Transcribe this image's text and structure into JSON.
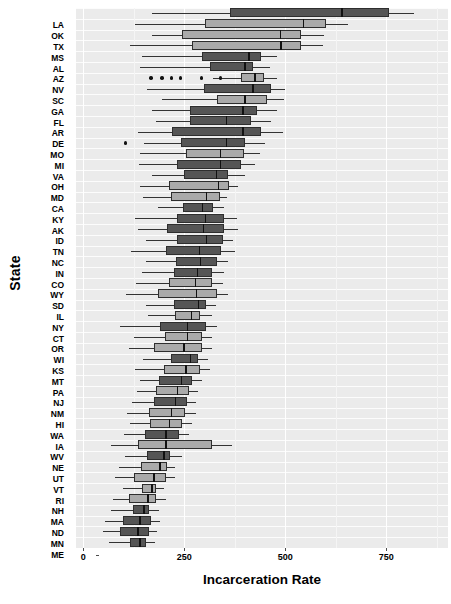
{
  "chart_data": {
    "type": "box",
    "title": "",
    "xlabel": "Incarceration Rate",
    "ylabel": "State",
    "xlim": [
      -18,
      903
    ],
    "xticks": [
      0,
      250,
      500,
      750
    ],
    "xticklabels": [
      "0",
      "250",
      "500",
      "750"
    ],
    "grid": true,
    "legend": "none",
    "orientation": "horizontal",
    "colors": {
      "panel_background": "#ebebeb",
      "gridline": "#ffffff",
      "box_dark": "#555555",
      "box_light": "#aaaaaa",
      "box_outline": "#2e2e2e",
      "median": "#111111",
      "whisker": "#333333",
      "outlier": "#111111",
      "text": "#000000"
    },
    "categories": [
      "LA",
      "OK",
      "TX",
      "MS",
      "AL",
      "AZ",
      "NV",
      "SC",
      "GA",
      "FL",
      "AR",
      "DE",
      "MO",
      "MI",
      "VA",
      "OH",
      "MD",
      "CA",
      "KY",
      "AK",
      "ID",
      "TN",
      "NC",
      "IN",
      "CO",
      "WY",
      "SD",
      "IL",
      "NY",
      "CT",
      "OR",
      "WI",
      "KS",
      "MT",
      "PA",
      "NJ",
      "NM",
      "HI",
      "WA",
      "IA",
      "WV",
      "NE",
      "UT",
      "VT",
      "RI",
      "NH",
      "MA",
      "ND",
      "MN",
      "ME"
    ],
    "boxes": [
      {
        "state": "LA",
        "whisker_low": 170,
        "q1": 363,
        "median": 640,
        "q3": 758,
        "whisker_high": 818,
        "shade": "dark",
        "outliers": []
      },
      {
        "state": "OK",
        "whisker_low": 128,
        "q1": 302,
        "median": 545,
        "q3": 600,
        "whisker_high": 655,
        "shade": "light",
        "outliers": []
      },
      {
        "state": "TX",
        "whisker_low": 170,
        "q1": 245,
        "median": 488,
        "q3": 540,
        "whisker_high": 595,
        "shade": "light",
        "outliers": []
      },
      {
        "state": "MS",
        "whisker_low": 115,
        "q1": 268,
        "median": 490,
        "q3": 540,
        "whisker_high": 593,
        "shade": "light",
        "outliers": []
      },
      {
        "state": "AL",
        "whisker_low": 145,
        "q1": 295,
        "median": 410,
        "q3": 440,
        "whisker_high": 480,
        "shade": "dark",
        "outliers": []
      },
      {
        "state": "AZ",
        "whisker_low": 140,
        "q1": 313,
        "median": 400,
        "q3": 420,
        "whisker_high": 463,
        "shade": "dark",
        "outliers": []
      },
      {
        "state": "NV",
        "whisker_low": 320,
        "q1": 390,
        "median": 425,
        "q3": 448,
        "whisker_high": 480,
        "shade": "light",
        "outliers": [
          168,
          195,
          218,
          240,
          292,
          340
        ]
      },
      {
        "state": "SC",
        "whisker_low": 158,
        "q1": 300,
        "median": 420,
        "q3": 465,
        "whisker_high": 500,
        "shade": "dark",
        "outliers": []
      },
      {
        "state": "GA",
        "whisker_low": 195,
        "q1": 330,
        "median": 400,
        "q3": 455,
        "whisker_high": 498,
        "shade": "light",
        "outliers": []
      },
      {
        "state": "FL",
        "whisker_low": 170,
        "q1": 265,
        "median": 395,
        "q3": 430,
        "whisker_high": 480,
        "shade": "dark",
        "outliers": []
      },
      {
        "state": "AR",
        "whisker_low": 180,
        "q1": 265,
        "median": 355,
        "q3": 415,
        "whisker_high": 465,
        "shade": "dark",
        "outliers": []
      },
      {
        "state": "DE",
        "whisker_low": 135,
        "q1": 220,
        "median": 395,
        "q3": 440,
        "whisker_high": 495,
        "shade": "dark",
        "outliers": []
      },
      {
        "state": "MO",
        "whisker_low": 150,
        "q1": 243,
        "median": 355,
        "q3": 400,
        "whisker_high": 450,
        "shade": "dark",
        "outliers": [
          105
        ]
      },
      {
        "state": "MI",
        "whisker_low": 140,
        "q1": 255,
        "median": 340,
        "q3": 398,
        "whisker_high": 438,
        "shade": "light",
        "outliers": []
      },
      {
        "state": "VA",
        "whisker_low": 138,
        "q1": 233,
        "median": 340,
        "q3": 390,
        "whisker_high": 425,
        "shade": "dark",
        "outliers": []
      },
      {
        "state": "OH",
        "whisker_low": 170,
        "q1": 250,
        "median": 330,
        "q3": 358,
        "whisker_high": 400,
        "shade": "dark",
        "outliers": []
      },
      {
        "state": "MD",
        "whisker_low": 140,
        "q1": 213,
        "median": 335,
        "q3": 360,
        "whisker_high": 383,
        "shade": "light",
        "outliers": []
      },
      {
        "state": "CA",
        "whisker_low": 148,
        "q1": 218,
        "median": 305,
        "q3": 338,
        "whisker_high": 355,
        "shade": "light",
        "outliers": []
      },
      {
        "state": "KY",
        "whisker_low": 185,
        "q1": 248,
        "median": 295,
        "q3": 320,
        "whisker_high": 348,
        "shade": "dark",
        "outliers": []
      },
      {
        "state": "AK",
        "whisker_low": 128,
        "q1": 233,
        "median": 303,
        "q3": 348,
        "whisker_high": 380,
        "shade": "dark",
        "outliers": []
      },
      {
        "state": "ID",
        "whisker_low": 135,
        "q1": 208,
        "median": 298,
        "q3": 348,
        "whisker_high": 383,
        "shade": "dark",
        "outliers": []
      },
      {
        "state": "TN",
        "whisker_low": 155,
        "q1": 233,
        "median": 305,
        "q3": 345,
        "whisker_high": 370,
        "shade": "dark",
        "outliers": []
      },
      {
        "state": "NC",
        "whisker_low": 118,
        "q1": 205,
        "median": 288,
        "q3": 340,
        "whisker_high": 375,
        "shade": "dark",
        "outliers": []
      },
      {
        "state": "IN",
        "whisker_low": 155,
        "q1": 230,
        "median": 290,
        "q3": 330,
        "whisker_high": 358,
        "shade": "dark",
        "outliers": []
      },
      {
        "state": "CO",
        "whisker_low": 145,
        "q1": 225,
        "median": 283,
        "q3": 318,
        "whisker_high": 348,
        "shade": "dark",
        "outliers": []
      },
      {
        "state": "WY",
        "whisker_low": 130,
        "q1": 213,
        "median": 278,
        "q3": 318,
        "whisker_high": 345,
        "shade": "light",
        "outliers": []
      },
      {
        "state": "SD",
        "whisker_low": 105,
        "q1": 185,
        "median": 280,
        "q3": 330,
        "whisker_high": 358,
        "shade": "light",
        "outliers": []
      },
      {
        "state": "IL",
        "whisker_low": 155,
        "q1": 225,
        "median": 285,
        "q3": 305,
        "whisker_high": 328,
        "shade": "dark",
        "outliers": []
      },
      {
        "state": "NY",
        "whisker_low": 160,
        "q1": 228,
        "median": 268,
        "q3": 290,
        "whisker_high": 318,
        "shade": "light",
        "outliers": []
      },
      {
        "state": "CT",
        "whisker_low": 90,
        "q1": 190,
        "median": 258,
        "q3": 303,
        "whisker_high": 330,
        "shade": "dark",
        "outliers": []
      },
      {
        "state": "OR",
        "whisker_low": 125,
        "q1": 203,
        "median": 258,
        "q3": 293,
        "whisker_high": 318,
        "shade": "light",
        "outliers": []
      },
      {
        "state": "WI",
        "whisker_low": 113,
        "q1": 175,
        "median": 250,
        "q3": 295,
        "whisker_high": 318,
        "shade": "light",
        "outliers": []
      },
      {
        "state": "KS",
        "whisker_low": 148,
        "q1": 218,
        "median": 265,
        "q3": 285,
        "whisker_high": 308,
        "shade": "dark",
        "outliers": []
      },
      {
        "state": "MT",
        "whisker_low": 128,
        "q1": 200,
        "median": 255,
        "q3": 288,
        "whisker_high": 313,
        "shade": "light",
        "outliers": []
      },
      {
        "state": "PA",
        "whisker_low": 140,
        "q1": 188,
        "median": 243,
        "q3": 270,
        "whisker_high": 293,
        "shade": "dark",
        "outliers": []
      },
      {
        "state": "NJ",
        "whisker_low": 133,
        "q1": 180,
        "median": 233,
        "q3": 263,
        "whisker_high": 285,
        "shade": "light",
        "outliers": []
      },
      {
        "state": "NM",
        "whisker_low": 120,
        "q1": 175,
        "median": 228,
        "q3": 258,
        "whisker_high": 280,
        "shade": "dark",
        "outliers": []
      },
      {
        "state": "HI",
        "whisker_low": 108,
        "q1": 163,
        "median": 218,
        "q3": 253,
        "whisker_high": 278,
        "shade": "light",
        "outliers": []
      },
      {
        "state": "WA",
        "whisker_low": 115,
        "q1": 165,
        "median": 213,
        "q3": 245,
        "whisker_high": 268,
        "shade": "light",
        "outliers": []
      },
      {
        "state": "IA",
        "whisker_low": 100,
        "q1": 153,
        "median": 205,
        "q3": 238,
        "whisker_high": 263,
        "shade": "dark",
        "outliers": []
      },
      {
        "state": "WV",
        "whisker_low": 68,
        "q1": 135,
        "median": 205,
        "q3": 318,
        "whisker_high": 368,
        "shade": "light",
        "outliers": []
      },
      {
        "state": "NE",
        "whisker_low": 103,
        "q1": 158,
        "median": 200,
        "q3": 215,
        "whisker_high": 245,
        "shade": "dark",
        "outliers": []
      },
      {
        "state": "UT",
        "whisker_low": 88,
        "q1": 143,
        "median": 190,
        "q3": 208,
        "whisker_high": 228,
        "shade": "light",
        "outliers": []
      },
      {
        "state": "VT",
        "whisker_low": 78,
        "q1": 125,
        "median": 175,
        "q3": 205,
        "whisker_high": 228,
        "shade": "light",
        "outliers": []
      },
      {
        "state": "RI",
        "whisker_low": 98,
        "q1": 145,
        "median": 170,
        "q3": 180,
        "whisker_high": 200,
        "shade": "light",
        "outliers": []
      },
      {
        "state": "NH",
        "whisker_low": 73,
        "q1": 113,
        "median": 160,
        "q3": 180,
        "whisker_high": 205,
        "shade": "light",
        "outliers": []
      },
      {
        "state": "MA",
        "whisker_low": 68,
        "q1": 123,
        "median": 150,
        "q3": 163,
        "whisker_high": 188,
        "shade": "dark",
        "outliers": []
      },
      {
        "state": "ND",
        "whisker_low": 55,
        "q1": 98,
        "median": 140,
        "q3": 168,
        "whisker_high": 190,
        "shade": "dark",
        "outliers": []
      },
      {
        "state": "MN",
        "whisker_low": 48,
        "q1": 90,
        "median": 135,
        "q3": 163,
        "whisker_high": 183,
        "shade": "dark",
        "outliers": []
      },
      {
        "state": "ME",
        "whisker_low": 63,
        "q1": 115,
        "median": 140,
        "q3": 155,
        "whisker_high": 178,
        "shade": "dark",
        "outliers": []
      }
    ]
  }
}
